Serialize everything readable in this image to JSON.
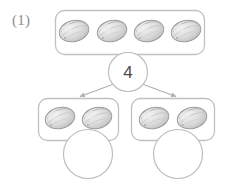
{
  "worksheet": {
    "item_label": "(1)",
    "background_color": "#ffffff",
    "line_color": "#b9b9b9",
    "text_color": "#8d8d8d"
  },
  "number_bond": {
    "whole": {
      "label": "4",
      "object_count": 4,
      "object_name": "stone",
      "filled": true
    },
    "parts": [
      {
        "label": "",
        "object_count": 2,
        "object_name": "stone",
        "filled": false
      },
      {
        "label": "",
        "object_count": 2,
        "object_name": "stone",
        "filled": false
      }
    ]
  },
  "objects": {
    "top_group": [
      "stone",
      "stone",
      "stone",
      "stone"
    ],
    "left_group": [
      "stone",
      "stone"
    ],
    "right_group": [
      "stone",
      "stone"
    ]
  },
  "colors": {
    "stone_fill": "#d8d8d8",
    "stone_outline": "#9a9a9a",
    "stone_highlight": "#eeeeee",
    "box_border": "#c0c0c0",
    "arrow": "#b0b0b0",
    "circle_border": "#bdbdbd"
  },
  "arrows": [
    {
      "name": "arrow-to-left-part",
      "direction": "down-left"
    },
    {
      "name": "arrow-to-right-part",
      "direction": "down-right"
    }
  ]
}
